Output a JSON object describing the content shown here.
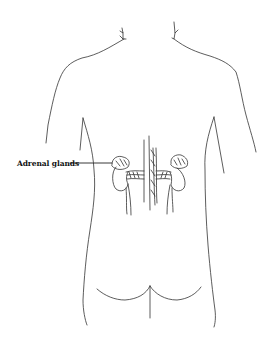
{
  "figure": {
    "type": "anatomical line drawing",
    "stroke_color": "#333333",
    "background_color": "#ffffff"
  },
  "labels": [
    {
      "text": "Adrenal glands",
      "target": "adrenal-glands",
      "x": 17,
      "y": 159
    }
  ]
}
